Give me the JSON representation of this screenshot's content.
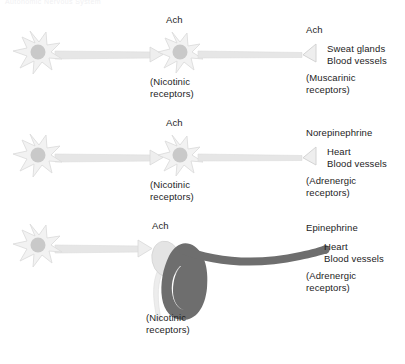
{
  "figure": {
    "top_partial_caption": "Autonomic Nervous System",
    "rows": [
      {
        "id": "somatic-cholinergic-pathway",
        "preganglionic_transmitter": "Ach",
        "ganglion_receptor": "(Nicotinic\nreceptors)",
        "postganglionic_transmitter": "Ach",
        "targets": "Sweat glands\nBlood vessels",
        "target_receptor": "(Muscarinic\nreceptors)"
      },
      {
        "id": "sympathetic-adrenergic-pathway",
        "preganglionic_transmitter": "Ach",
        "ganglion_receptor": "(Nicotinic\nreceptors)",
        "postganglionic_transmitter": "Norepinephrine",
        "targets": "Heart\nBlood vessels",
        "target_receptor": "(Adrenergic\nreceptors)"
      },
      {
        "id": "adrenal-medulla-pathway",
        "preganglionic_transmitter": "Ach",
        "ganglion_receptor": "(Nicotinic\nreceptors)",
        "postganglionic_transmitter": "Epinephrine",
        "targets": "Heart\nBlood vessels",
        "target_receptor": "(Adrenergic\nreceptors)"
      }
    ]
  },
  "colors": {
    "neuron_fill": "#f2f2f2",
    "neuron_outline": "#d8d8d8",
    "nucleus_fill": "#c9c9c9",
    "axon_fill": "#e6e6e6",
    "adrenal_gland_fill": "#e4e4e4",
    "kidney_fill": "#6e6e6e",
    "vessel_fill": "#6e6e6e",
    "ureter_fill": "#ededed",
    "text": "#1d1d1d",
    "background": "#ffffff"
  }
}
